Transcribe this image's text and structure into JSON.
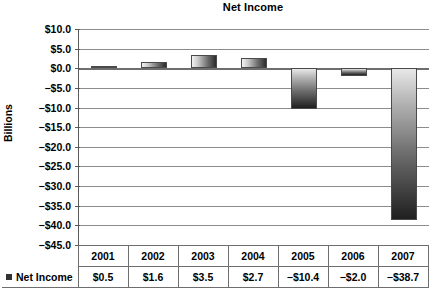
{
  "chart_data": {
    "type": "bar",
    "title": "Net Income",
    "xlabel": "",
    "ylabel": "Billions",
    "categories": [
      "2001",
      "2002",
      "2003",
      "2004",
      "2005",
      "2006",
      "2007"
    ],
    "series": [
      {
        "name": "Net Income",
        "values": [
          0.5,
          1.6,
          3.5,
          2.7,
          -10.4,
          -2.0,
          -38.7
        ],
        "labels": [
          "$0.5",
          "$1.6",
          "$3.5",
          "$2.7",
          "−$10.4",
          "−$2.0",
          "−$38.7"
        ]
      }
    ],
    "ylim": [
      -45.0,
      10.0
    ],
    "ytick_step": 5.0,
    "ytick_labels": [
      "$10.0",
      "$5.0",
      "$0.0",
      "−$5.0",
      "−$10.0",
      "−$15.0",
      "−$20.0",
      "−$25.0",
      "−$30.0",
      "−$35.0",
      "−$40.0",
      "−$45.0"
    ],
    "ytick_values": [
      10.0,
      5.0,
      0.0,
      -5.0,
      -10.0,
      -15.0,
      -20.0,
      -25.0,
      -30.0,
      -35.0,
      -40.0,
      -45.0
    ],
    "grid": true,
    "legend_position": "data-table",
    "legend": [
      "Net Income"
    ],
    "colors": {
      "bar_light": "#f2f2f2",
      "bar_dark": "#1f1f1f",
      "gridline": "#8c8c8c",
      "axis": "#5a5a5a",
      "text": "#000000",
      "background": "#ffffff"
    }
  },
  "table": {
    "series_label": "Net Income",
    "header": [
      "2001",
      "2002",
      "2003",
      "2004",
      "2005",
      "2006",
      "2007"
    ],
    "row": [
      "$0.5",
      "$1.6",
      "$3.5",
      "$2.7",
      "−$10.4",
      "−$2.0",
      "−$38.7"
    ]
  }
}
